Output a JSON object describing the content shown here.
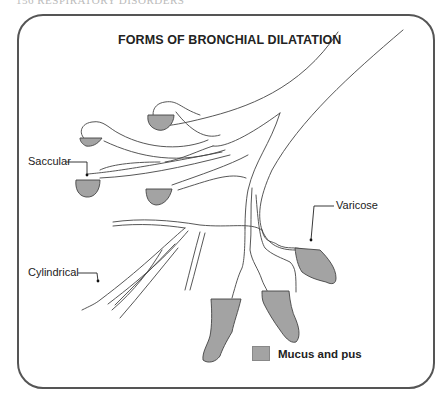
{
  "page": {
    "header": "156 RESPIRATORY DISORDERS"
  },
  "figure": {
    "title": "FORMS OF BRONCHIAL DILATATION",
    "labels": {
      "saccular": "Saccular",
      "cylindrical": "Cylindrical",
      "varicose": "Varicose"
    },
    "legend": {
      "label": "Mucus and pus",
      "color": "#a3a3a3"
    },
    "colors": {
      "outline": "#444444",
      "fill": "#a3a3a3",
      "frame": "#555555"
    }
  }
}
